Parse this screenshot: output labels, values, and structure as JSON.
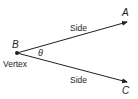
{
  "diagram": {
    "type": "angle",
    "vertex": {
      "label": "B",
      "caption": "Vertex"
    },
    "angle_symbol": "θ",
    "rays": [
      {
        "endpoint_label": "A",
        "side_label": "Side"
      },
      {
        "endpoint_label": "C",
        "side_label": "Side"
      }
    ],
    "colors": {
      "stroke": "#231f20",
      "background": "#ffffff"
    }
  }
}
